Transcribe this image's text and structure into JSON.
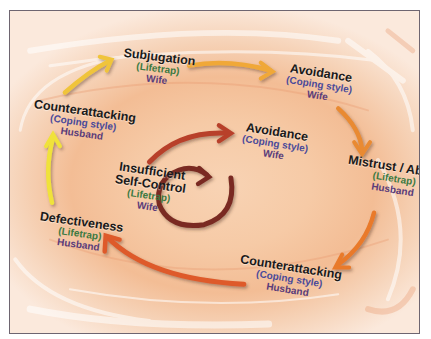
{
  "diagram": {
    "colors": {
      "lifetrap_label": "#3c7a42",
      "coping_label": "#4a4a9a",
      "person_label": "#5a3c7a",
      "arrow_yellow": "#f0e23a",
      "arrow_gold": "#f0b030",
      "arrow_orange": "#e9792c",
      "arrow_redorange": "#de5a2a",
      "arrow_red": "#b8402a",
      "arrow_darkred": "#7a2c22",
      "frame_border": "#6e6570"
    },
    "outer_cycle": [
      {
        "title": "Defectiveness",
        "type": "(Lifetrap)",
        "person": "Husband"
      },
      {
        "title": "Counterattacking",
        "type": "(Coping style)",
        "person": "Husband"
      },
      {
        "title": "Subjugation",
        "type": "(Lifetrap)",
        "person": "Wife"
      },
      {
        "title": "Avoidance",
        "type": "(Coping style)",
        "person": "Wife"
      },
      {
        "title": "Mistrust / Abuse",
        "type": "(Lifetrap)",
        "person": "Husband"
      },
      {
        "title": "Counterattacking",
        "type": "(Coping style)",
        "person": "Husband"
      }
    ],
    "inner_cycle": [
      {
        "title_line1": "Insufficient",
        "title_line2": "Self-Control",
        "type": "(Lifetrap)",
        "person": "Wife"
      },
      {
        "title": "Avoidance",
        "type": "(Coping style)",
        "person": "Wife"
      }
    ],
    "center_icon": "circular-arrow-icon"
  }
}
